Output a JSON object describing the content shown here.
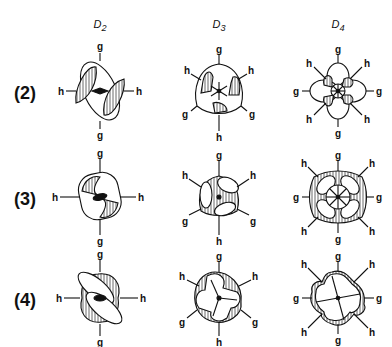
{
  "columns": [
    {
      "label": "D",
      "sub": "2",
      "x": 100
    },
    {
      "label": "D",
      "sub": "3",
      "x": 219
    },
    {
      "label": "D",
      "sub": "4",
      "x": 338
    }
  ],
  "rows": [
    {
      "label": "(2)",
      "y": 91
    },
    {
      "label": "(3)",
      "y": 197
    },
    {
      "label": "(4)",
      "y": 298
    }
  ],
  "axis_labels": {
    "two_fold_g": "g",
    "two_fold_h": "h"
  },
  "colors": {
    "ink": "#111111",
    "hatch": "#444444",
    "paper": "#ffffff"
  }
}
